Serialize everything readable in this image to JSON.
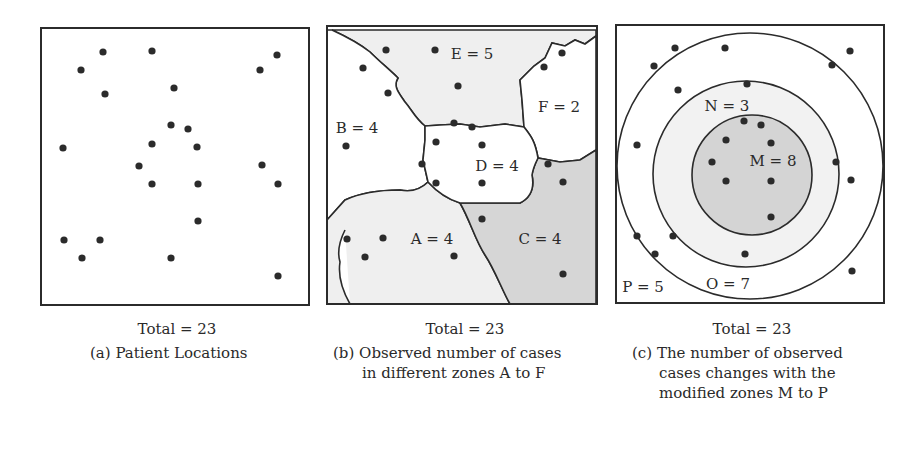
{
  "panels": [
    {
      "id": "a",
      "total_label": "Total = 23",
      "caption_tag": "(a)",
      "caption_lines": [
        "Patient Locations"
      ],
      "points": [
        [
          103,
          52
        ],
        [
          152,
          51
        ],
        [
          81,
          70
        ],
        [
          105,
          94
        ],
        [
          174,
          88
        ],
        [
          260,
          70
        ],
        [
          277,
          55
        ],
        [
          171,
          125
        ],
        [
          188,
          129
        ],
        [
          63,
          148
        ],
        [
          152,
          144
        ],
        [
          197,
          147
        ],
        [
          139,
          166
        ],
        [
          262,
          165
        ],
        [
          152,
          184
        ],
        [
          198,
          184
        ],
        [
          278,
          184
        ],
        [
          198,
          221
        ],
        [
          64,
          240
        ],
        [
          100,
          240
        ],
        [
          82,
          258
        ],
        [
          171,
          258
        ],
        [
          278,
          276
        ]
      ]
    },
    {
      "id": "b",
      "total_label": "Total = 23",
      "caption_tag": "(b)",
      "caption_lines": [
        "Observed number of cases",
        "in different zones A to F"
      ],
      "zones": [
        {
          "label": "E = 5",
          "x": 472,
          "y": 55
        },
        {
          "label": "F = 2",
          "x": 559,
          "y": 108
        },
        {
          "label": "B = 4",
          "x": 357,
          "y": 129
        },
        {
          "label": "D = 4",
          "x": 497,
          "y": 167
        },
        {
          "label": "A = 4",
          "x": 432,
          "y": 240
        },
        {
          "label": "C = 4",
          "x": 540,
          "y": 240
        }
      ],
      "points": [
        [
          386,
          50
        ],
        [
          435,
          50
        ],
        [
          363,
          68
        ],
        [
          388,
          93
        ],
        [
          458,
          86
        ],
        [
          562,
          53
        ],
        [
          544,
          67
        ],
        [
          346,
          146
        ],
        [
          454,
          123
        ],
        [
          472,
          127
        ],
        [
          436,
          142
        ],
        [
          482,
          145
        ],
        [
          422,
          164
        ],
        [
          436,
          183
        ],
        [
          482,
          183
        ],
        [
          548,
          164
        ],
        [
          563,
          182
        ],
        [
          482,
          219
        ],
        [
          347,
          239
        ],
        [
          383,
          238
        ],
        [
          365,
          257
        ],
        [
          454,
          256
        ],
        [
          563,
          274
        ]
      ]
    },
    {
      "id": "c",
      "total_label": "Total = 23",
      "caption_tag": "(c)",
      "caption_lines": [
        "The number of observed",
        "cases changes with the",
        "modified zones M to P"
      ],
      "zones": [
        {
          "label": "N = 3",
          "x": 727,
          "y": 107
        },
        {
          "label": "M = 8",
          "x": 773,
          "y": 162
        },
        {
          "label": "P = 5",
          "x": 643,
          "y": 288
        },
        {
          "label": "O = 7",
          "x": 728,
          "y": 285
        }
      ],
      "points": [
        [
          675,
          48
        ],
        [
          725,
          48
        ],
        [
          654,
          66
        ],
        [
          850,
          51
        ],
        [
          832,
          65
        ],
        [
          747,
          84
        ],
        [
          678,
          90
        ],
        [
          637,
          145
        ],
        [
          744,
          121
        ],
        [
          761,
          125
        ],
        [
          726,
          140
        ],
        [
          771,
          143
        ],
        [
          712,
          162
        ],
        [
          836,
          162
        ],
        [
          726,
          181
        ],
        [
          771,
          181
        ],
        [
          851,
          180
        ],
        [
          771,
          217
        ],
        [
          637,
          236
        ],
        [
          673,
          236
        ],
        [
          655,
          254
        ],
        [
          745,
          254
        ],
        [
          852,
          271
        ]
      ]
    }
  ],
  "colors": {
    "line": "#2b2b2b",
    "dot": "#2b2b2b",
    "zone_light": "#efefef",
    "zone_dark": "#d6d6d6",
    "circle_inner": "#d4d4d4",
    "circle_mid": "#f2f2f2"
  }
}
